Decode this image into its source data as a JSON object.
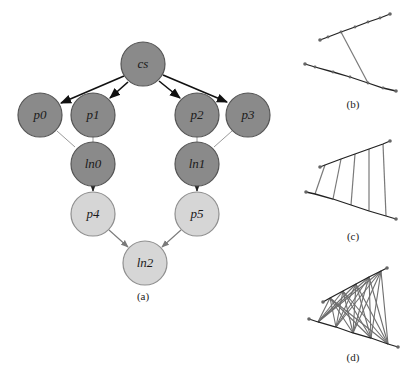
{
  "figure": {
    "panels": [
      {
        "id": "a",
        "caption": "(a)"
      },
      {
        "id": "b",
        "caption": "(b)"
      },
      {
        "id": "c",
        "caption": "(c)"
      },
      {
        "id": "d",
        "caption": "(d)"
      }
    ]
  },
  "graph": {
    "colors": {
      "dark_node_fill": "#8a8a8a",
      "dark_node_stroke": "#555555",
      "light_node_fill": "#d6d6d6",
      "light_node_stroke": "#8f8f8f",
      "strong_edge": "#111111",
      "weak_edge": "#8a8a8a"
    },
    "nodes": [
      {
        "id": "cs",
        "label": "cs",
        "style": "dark"
      },
      {
        "id": "p0",
        "label": "p0",
        "style": "dark"
      },
      {
        "id": "p1",
        "label": "p1",
        "style": "dark"
      },
      {
        "id": "p2",
        "label": "p2",
        "style": "dark"
      },
      {
        "id": "p3",
        "label": "p3",
        "style": "dark"
      },
      {
        "id": "ln0",
        "label": "ln0",
        "style": "dark"
      },
      {
        "id": "ln1",
        "label": "ln1",
        "style": "dark"
      },
      {
        "id": "p4",
        "label": "p4",
        "style": "light"
      },
      {
        "id": "p5",
        "label": "p5",
        "style": "light"
      },
      {
        "id": "ln2",
        "label": "ln2",
        "style": "light"
      }
    ],
    "edges": [
      {
        "from": "cs",
        "to": "p0",
        "type": "arrow-strong"
      },
      {
        "from": "cs",
        "to": "p1",
        "type": "arrow-strong"
      },
      {
        "from": "cs",
        "to": "p2",
        "type": "arrow-strong"
      },
      {
        "from": "cs",
        "to": "p3",
        "type": "arrow-strong"
      },
      {
        "from": "p0",
        "to": "ln0",
        "type": "line-weak"
      },
      {
        "from": "p1",
        "to": "ln0",
        "type": "line-weak"
      },
      {
        "from": "p2",
        "to": "ln1",
        "type": "line-weak"
      },
      {
        "from": "p3",
        "to": "ln1",
        "type": "line-weak"
      },
      {
        "from": "ln0",
        "to": "p4",
        "type": "arrow-short"
      },
      {
        "from": "ln1",
        "to": "p5",
        "type": "arrow-short"
      },
      {
        "from": "p4",
        "to": "ln2",
        "type": "arrow-weak"
      },
      {
        "from": "p5",
        "to": "ln2",
        "type": "arrow-weak"
      }
    ]
  },
  "polylines": {
    "b": {
      "description": "two polylines joined by a single connector",
      "connectors": 1
    },
    "c": {
      "description": "two polylines joined by vertex-to-vertex rungs",
      "connectors": 6
    },
    "d": {
      "description": "two polylines fully cross-connected",
      "connectors": "all-pairs"
    }
  }
}
